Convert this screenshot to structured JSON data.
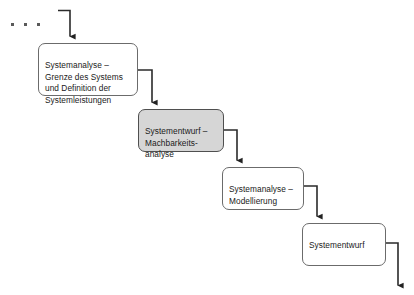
{
  "diagram": {
    "type": "waterfall-process-flow",
    "background_color": "#ffffff",
    "line_color": "#333333",
    "box_border_color": "#6b6b6b",
    "box_fill_default": "#ffffff",
    "box_fill_highlight": "#d6d6d6",
    "text_color": "#1a1a1a",
    "continuation": {
      "name": "ellipsis",
      "dots": 3
    },
    "boxes": [
      {
        "id": "analysis-boundaries",
        "label": "Systemanalyse –\nGrenze des Systems\nund Definition der\nSystemleistungen",
        "highlighted": false
      },
      {
        "id": "design-feasibility",
        "label": "Systementwurf –\nMachbarkeits-\nanalyse",
        "highlighted": true
      },
      {
        "id": "analysis-modelling",
        "label": "Systemanalyse –\nModellierung",
        "highlighted": false
      },
      {
        "id": "system-design",
        "label": "Systementwurf",
        "highlighted": false
      }
    ],
    "connectors": [
      {
        "id": "entry-arrow",
        "from": "previous-phase",
        "to": "analysis-boundaries"
      },
      {
        "id": "connector-1",
        "from": "analysis-boundaries",
        "to": "design-feasibility"
      },
      {
        "id": "connector-2",
        "from": "design-feasibility",
        "to": "analysis-modelling"
      },
      {
        "id": "connector-3",
        "from": "analysis-modelling",
        "to": "system-design"
      },
      {
        "id": "exit-arrow",
        "from": "system-design",
        "to": "next-phase"
      }
    ]
  }
}
